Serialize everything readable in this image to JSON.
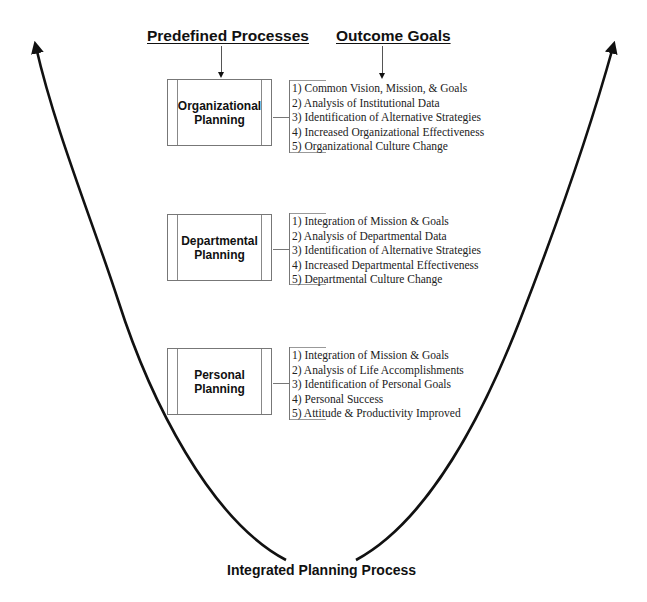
{
  "headers": {
    "processes": "Predefined Processes",
    "goals": "Outcome Goals"
  },
  "levels": [
    {
      "process": [
        "Organizational",
        "Planning"
      ],
      "goals": [
        "1) Common Vision, Mission, & Goals",
        "2) Analysis of Institutional Data",
        "3) Identification of Alternative Strategies",
        "4) Increased Organizational Effectiveness",
        "5) Organizational Culture Change"
      ]
    },
    {
      "process": [
        "Departmental",
        "Planning"
      ],
      "goals": [
        "1) Integration of Mission & Goals",
        "2) Analysis of Departmental Data",
        "3) Identification of Alternative Strategies",
        "4) Increased Departmental Effectiveness",
        "5) Departmental Culture Change"
      ]
    },
    {
      "process": [
        "Personal",
        "Planning"
      ],
      "goals": [
        "1) Integration of Mission & Goals",
        "2) Analysis of Life Accomplishments",
        "3) Identification of Personal Goals",
        "4) Personal Success",
        "5) Attitude & Productivity Improved"
      ]
    }
  ],
  "footer": {
    "title": "Integrated Planning Process"
  },
  "icons": {
    "curve": "u-shaped-double-arrow-curve",
    "header_arrows": "down-arrow"
  },
  "colors": {
    "line": "#111111",
    "box_border": "#777777",
    "text": "#222222"
  }
}
